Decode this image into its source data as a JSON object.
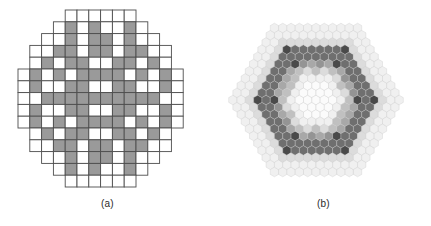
{
  "figure": {
    "background_color": "#ffffff",
    "panel_count": 2
  },
  "panels": [
    {
      "id": "a",
      "caption": "(a)",
      "type": "square-grid-disk",
      "description": "Pixelated disk made of square cells arranged in a circular aperture, cells shaded white or gray",
      "grid": {
        "columns": 14,
        "rows": 15,
        "cell_size_px": 11.8,
        "origin_x_px": 18,
        "origin_y_px": 10,
        "stroke_color": "#4d4d4d",
        "stroke_width_px": 0.9
      },
      "colors": {
        "empty": "#ffffff",
        "light": "#f2f2f2",
        "gray": "#9a9a9a"
      },
      "row_offsets": [
        4,
        3,
        2,
        1,
        1,
        0,
        0,
        0,
        0,
        0,
        1,
        1,
        2,
        3,
        4
      ],
      "row_lengths": [
        6,
        8,
        10,
        12,
        12,
        14,
        14,
        14,
        14,
        14,
        12,
        12,
        10,
        8,
        6
      ],
      "cell_states": [
        [
          0,
          0,
          0,
          0,
          0,
          0
        ],
        [
          0,
          1,
          0,
          1,
          0,
          0,
          1,
          0
        ],
        [
          0,
          0,
          1,
          0,
          1,
          1,
          0,
          1,
          0,
          0
        ],
        [
          0,
          0,
          1,
          1,
          0,
          1,
          1,
          0,
          1,
          1,
          0,
          0
        ],
        [
          0,
          1,
          0,
          1,
          1,
          0,
          0,
          1,
          1,
          0,
          1,
          0
        ],
        [
          0,
          1,
          0,
          1,
          0,
          1,
          1,
          1,
          1,
          0,
          1,
          0,
          1,
          0
        ],
        [
          0,
          1,
          0,
          0,
          1,
          1,
          0,
          0,
          1,
          1,
          0,
          0,
          1,
          0
        ],
        [
          0,
          0,
          1,
          1,
          1,
          1,
          1,
          1,
          1,
          1,
          1,
          1,
          0,
          0
        ],
        [
          0,
          1,
          0,
          0,
          1,
          1,
          0,
          0,
          1,
          1,
          0,
          0,
          1,
          0
        ],
        [
          0,
          1,
          0,
          1,
          0,
          1,
          1,
          1,
          1,
          0,
          1,
          0,
          1,
          0
        ],
        [
          0,
          1,
          0,
          1,
          1,
          0,
          0,
          1,
          1,
          0,
          1,
          0
        ],
        [
          0,
          0,
          1,
          1,
          0,
          1,
          1,
          0,
          1,
          1,
          0,
          0
        ],
        [
          0,
          0,
          1,
          0,
          1,
          1,
          0,
          1,
          0,
          0
        ],
        [
          0,
          1,
          0,
          1,
          0,
          0,
          1,
          0
        ],
        [
          0,
          0,
          0,
          0,
          0,
          0
        ]
      ]
    },
    {
      "id": "b",
      "caption": "(b)",
      "type": "hexagonal-array",
      "description": "Honeycomb array of hexagonal cells forming a large hexagon, with concentric rings shaded from white through light gray, mid gray and dark gray",
      "lattice": {
        "radius_rings": 10,
        "hex_radius_px": 4.8,
        "center_x_px": 100,
        "center_y_px": 100,
        "orientation": "pointy-top",
        "stroke_color": "#c8c8c8",
        "stroke_width_px": 0.35
      },
      "colors": {
        "white": "#fbfbfb",
        "light": "#f0f0f0",
        "pale": "#dcdcdc",
        "mid_light": "#c0c0c0",
        "mid": "#a8a8a8",
        "gray": "#949494",
        "dark": "#6f6f6f",
        "darkest": "#4a4a4a"
      },
      "ring_shades": [
        "white",
        "white",
        "white",
        "light",
        "mid_light",
        "gray",
        "dark",
        "dark",
        "light",
        "light",
        "light"
      ],
      "accent_ring_index": 7,
      "accent_count": 12,
      "inner_accent_ring_index": 5,
      "inner_accent_count": 6
    }
  ]
}
